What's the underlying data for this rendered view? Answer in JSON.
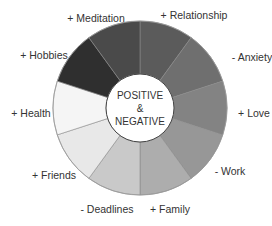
{
  "chart_data": {
    "type": "pie",
    "variant": "donut",
    "title": "POSITIVE & NEGATIVE",
    "center_label": [
      "POSITIVE",
      "&",
      "NEGATIVE"
    ],
    "start_angle_deg": 0,
    "direction": "clockwise",
    "segments": [
      {
        "label": "+ Relationship",
        "value": 1,
        "color": "#5b5b5b",
        "label_x": 194,
        "label_y": 19,
        "anchor": "middle"
      },
      {
        "label": "- Anxiety",
        "value": 1,
        "color": "#6f6f6f",
        "label_x": 252,
        "label_y": 61,
        "anchor": "middle"
      },
      {
        "label": "+ Love",
        "value": 1,
        "color": "#838383",
        "label_x": 254,
        "label_y": 117,
        "anchor": "middle"
      },
      {
        "label": "- Work",
        "value": 1,
        "color": "#979797",
        "label_x": 230,
        "label_y": 175,
        "anchor": "middle"
      },
      {
        "label": "+ Family",
        "value": 1,
        "color": "#adadad",
        "label_x": 170,
        "label_y": 213,
        "anchor": "middle"
      },
      {
        "label": "- Deadlines",
        "value": 1,
        "color": "#c9c9c9",
        "label_x": 107,
        "label_y": 213,
        "anchor": "middle"
      },
      {
        "label": "+ Friends",
        "value": 1,
        "color": "#e8e8e8",
        "label_x": 54,
        "label_y": 179,
        "anchor": "middle"
      },
      {
        "label": "+ Health",
        "value": 1,
        "color": "#f5f5f5",
        "label_x": 31,
        "label_y": 117,
        "anchor": "middle"
      },
      {
        "label": "+ Hobbies",
        "value": 1,
        "color": "#2f2f2f",
        "label_x": 44,
        "label_y": 59,
        "anchor": "middle"
      },
      {
        "label": "+ Meditation",
        "value": 1,
        "color": "#4a4a4a",
        "label_x": 96,
        "label_y": 22,
        "anchor": "middle"
      }
    ],
    "geometry": {
      "cx": 140,
      "cy": 108,
      "outer_r": 87,
      "inner_r": 34
    },
    "legend": "none"
  }
}
